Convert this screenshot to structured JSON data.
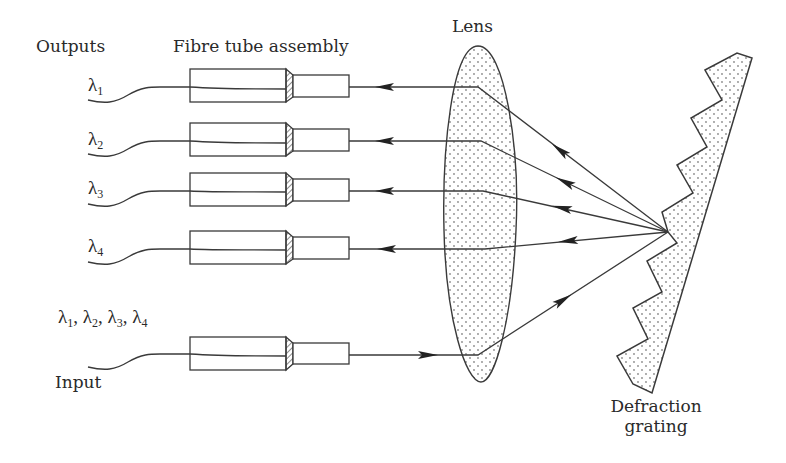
{
  "diagram": {
    "labels": {
      "outputs": "Outputs",
      "fibre_tube_assembly": "Fibre tube assembly",
      "lens": "Lens",
      "grating_line1": "Defraction",
      "grating_line2": "grating",
      "input": "Input",
      "input_wavelengths": "λ1, λ2, λ3, λ4"
    },
    "outputs": [
      {
        "symbol": "λ",
        "subscript": "1",
        "center_y": 87
      },
      {
        "symbol": "λ",
        "subscript": "2",
        "center_y": 141
      },
      {
        "symbol": "λ",
        "subscript": "3",
        "center_y": 191
      },
      {
        "symbol": "λ",
        "subscript": "4",
        "center_y": 249
      }
    ],
    "input": {
      "wavelengths": [
        {
          "symbol": "λ",
          "subscript": "1"
        },
        {
          "symbol": "λ",
          "subscript": "2"
        },
        {
          "symbol": "λ",
          "subscript": "3"
        },
        {
          "symbol": "λ",
          "subscript": "4"
        }
      ],
      "center_y": 355
    },
    "components": [
      "fibre tube assembly (x5)",
      "lens",
      "diffraction grating"
    ],
    "colors": {
      "stroke": "#3a3a3a",
      "dot_fill": "#8a8a8a",
      "text": "#2a2a2a"
    }
  }
}
